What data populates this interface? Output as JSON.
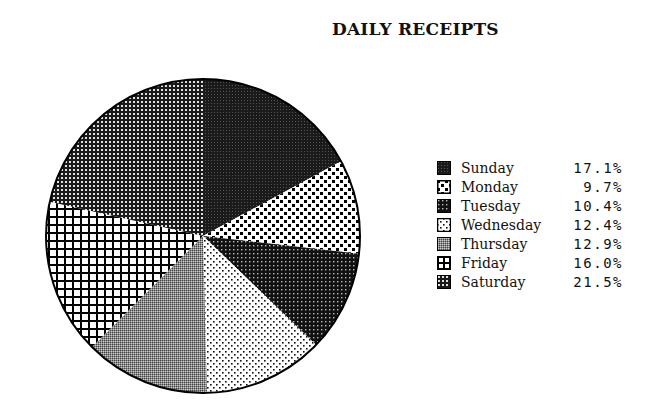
{
  "chart_data": {
    "type": "pie",
    "title": "DAILY RECEIPTS",
    "start_angle": "12 o'clock",
    "direction": "clockwise",
    "legend_position": "right",
    "slices": [
      {
        "label": "Sunday",
        "value": 17.1,
        "value_label": "17.1%",
        "pattern": "solid-dark"
      },
      {
        "label": "Monday",
        "value": 9.7,
        "value_label": "9.7%",
        "pattern": "checker-squares"
      },
      {
        "label": "Tuesday",
        "value": 10.4,
        "value_label": "10.4%",
        "pattern": "dark-fine-dots"
      },
      {
        "label": "Wednesday",
        "value": 12.4,
        "value_label": "12.4%",
        "pattern": "sparse-dots"
      },
      {
        "label": "Thursday",
        "value": 12.9,
        "value_label": "12.9%",
        "pattern": "gray-halftone"
      },
      {
        "label": "Friday",
        "value": 16.0,
        "value_label": "16.0%",
        "pattern": "open-grid"
      },
      {
        "label": "Saturday",
        "value": 21.5,
        "value_label": "21.5%",
        "pattern": "fine-grid"
      }
    ]
  }
}
